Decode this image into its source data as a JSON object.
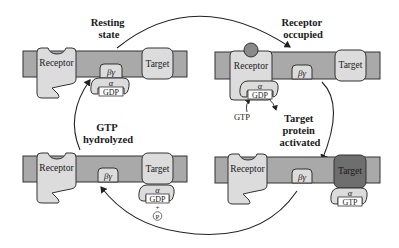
{
  "diagram": {
    "type": "G-protein activation cycle",
    "colors": {
      "membrane": "#a9a9a9",
      "protein": "#dcdcdc",
      "activated_target": "#6e6e6e",
      "ligand": "#8a8a8a",
      "outline": "#333333"
    },
    "stage_labels": {
      "resting": [
        "Resting",
        "state"
      ],
      "occupied": [
        "Receptor",
        "occupied"
      ],
      "activated": [
        "Target",
        "protein",
        "activated"
      ],
      "hydrolyzed": [
        "GTP",
        "hydrolyzed"
      ]
    },
    "panels": [
      {
        "id": "resting-state",
        "receptor": "Receptor",
        "target": "Target",
        "beta_gamma": "βγ",
        "alpha": "α",
        "nucleotide": "GDP"
      },
      {
        "id": "receptor-occupied",
        "receptor": "Receptor",
        "target": "Target",
        "beta_gamma": "βγ",
        "alpha": "α",
        "nucleotide": "GDP",
        "gtp_in": "GTP"
      },
      {
        "id": "gtp-hydrolyzed",
        "receptor": "Receptor",
        "target": "Target",
        "beta_gamma": "βγ",
        "alpha": "α",
        "nucleotide": "GDP",
        "plus": "+",
        "phosphate": "P"
      },
      {
        "id": "target-activated",
        "receptor": "Receptor",
        "target": "Target",
        "beta_gamma": "βγ",
        "alpha": "α",
        "nucleotide": "GTP"
      }
    ]
  }
}
